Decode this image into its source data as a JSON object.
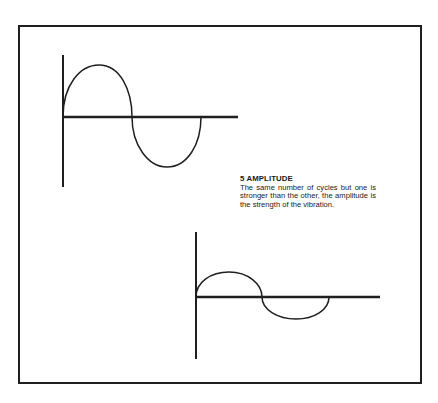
{
  "page": {
    "number_fragment": "··"
  },
  "caption": {
    "title": "5 AMPLITUDE",
    "body": "The same number of cycles but one is stronger than the other, the amplitude is the strength of the vibration."
  },
  "figures": {
    "wave_large": {
      "description": "Sine wave, one full cycle, large amplitude",
      "cycles": 1,
      "amplitude": "large"
    },
    "wave_small": {
      "description": "Sine wave, one full cycle, small amplitude",
      "cycles": 1,
      "amplitude": "small"
    }
  },
  "colors": {
    "ink": "#1f1f1f",
    "paper": "#ffffff"
  }
}
